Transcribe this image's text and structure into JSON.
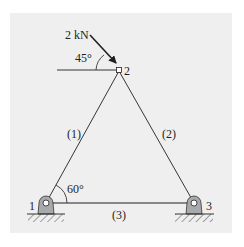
{
  "figure": {
    "type": "planar truss",
    "background_color": "#efefef",
    "line_color": "#231f20",
    "support_fill": "#a7a9ac"
  },
  "load": {
    "magnitude_label": "2 kN",
    "angle_label": "45°",
    "applied_at_node": "2"
  },
  "angle_at_node_1": "60°",
  "nodes": [
    {
      "id": "1",
      "label": "1",
      "support": "pin"
    },
    {
      "id": "2",
      "label": "2",
      "support": "none"
    },
    {
      "id": "3",
      "label": "3",
      "support": "pin"
    }
  ],
  "members": [
    {
      "label": "(1)",
      "from": "1",
      "to": "2"
    },
    {
      "label": "(2)",
      "from": "2",
      "to": "3"
    },
    {
      "label": "(3)",
      "from": "1",
      "to": "3"
    }
  ]
}
